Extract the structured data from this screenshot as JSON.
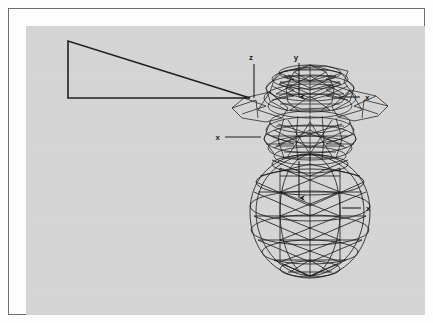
{
  "figure": {
    "type": "technical-line-drawing",
    "background_color": "#d5d5d5",
    "frame_color": "#6e6e6e",
    "page_color": "#fdfdfd",
    "line_color": "#1a1a1a",
    "canvas": {
      "x": 17,
      "y": 17,
      "width": 399,
      "height": 289
    }
  },
  "wedge": {
    "name": "triangular-wedge-profile",
    "apex": {
      "x": 241,
      "y": 89
    },
    "top_left": {
      "x": 59,
      "y": 32
    },
    "bottom_left": {
      "x": 59,
      "y": 89
    }
  },
  "axes": [
    {
      "id": "z-axis",
      "label": "z",
      "label_x": 242,
      "label_y": 50,
      "line_from": {
        "x": 245,
        "y": 55
      },
      "line_to": {
        "x": 245,
        "y": 89
      },
      "arrow": "none",
      "orientation": "vertical"
    },
    {
      "id": "y-axis-upper",
      "label": "y",
      "label_x": 287,
      "label_y": 50,
      "line_from": {
        "x": 290,
        "y": 54
      },
      "line_to": {
        "x": 290,
        "y": 90
      },
      "arrow": "down",
      "orientation": "vertical"
    },
    {
      "id": "x-axis-upper-right",
      "label": "x",
      "label_x": 355,
      "label_y": 91,
      "line_from": {
        "x": 330,
        "y": 88
      },
      "line_to": {
        "x": 351,
        "y": 88
      },
      "arrow": "none",
      "orientation": "horizontal"
    },
    {
      "id": "x-axis-mid-left",
      "label": "x",
      "label_x": 210,
      "label_y": 131,
      "line_from": {
        "x": 216,
        "y": 128
      },
      "line_to": {
        "x": 252,
        "y": 128
      },
      "arrow": "none",
      "orientation": "horizontal"
    },
    {
      "id": "y-axis-lower",
      "label": "",
      "line_from": {
        "x": 290,
        "y": 152
      },
      "line_to": {
        "x": 290,
        "y": 190
      },
      "arrow": "down",
      "orientation": "vertical"
    },
    {
      "id": "x-axis-lower-right",
      "label": "x",
      "label_x": 356,
      "label_y": 202,
      "line_from": {
        "x": 333,
        "y": 199
      },
      "line_to": {
        "x": 352,
        "y": 199
      },
      "arrow": "none",
      "orientation": "horizontal"
    }
  ],
  "bodies": [
    {
      "id": "upper-dome-mesh",
      "name": "Upper faceted dome",
      "center": {
        "x": 293,
        "y": 98
      },
      "radius_x": 48,
      "radius_y": 40,
      "facets": 14,
      "rings": 5,
      "line_weight": 0.8
    },
    {
      "id": "waist-collar-mesh",
      "name": "Waist collar band",
      "center": {
        "x": 293,
        "y": 135
      },
      "radius_x": 38,
      "radius_y": 22,
      "facets": 14,
      "rings": 4,
      "line_weight": 0.8
    },
    {
      "id": "lower-ellipsoid-mesh",
      "name": "Lower ellipsoid body",
      "center": {
        "x": 293,
        "y": 203
      },
      "radius_x": 48,
      "radius_y": 65,
      "facets": 12,
      "rings": 6,
      "line_weight": 0.9
    }
  ],
  "labels_summary": {
    "unique_labels": [
      "z",
      "y",
      "x"
    ],
    "x_count": 3,
    "y_count": 1,
    "z_count": 1
  }
}
